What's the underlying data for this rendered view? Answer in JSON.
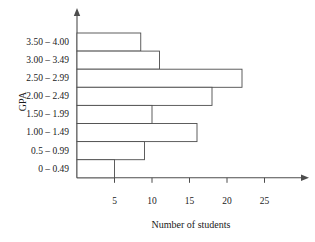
{
  "chart_data": {
    "type": "bar",
    "orientation": "horizontal",
    "title": "",
    "xlabel": "Number of students",
    "ylabel": "GPA",
    "categories": [
      "3.50 – 4.00",
      "3.00 – 3.49",
      "2.50 – 2.99",
      "2.00 – 2.49",
      "1.50 – 1.99",
      "1.00 – 1.49",
      "0.5 – 0.99",
      "0 – 0.49"
    ],
    "values": [
      8.5,
      11,
      22,
      18,
      10,
      16,
      9,
      5
    ],
    "xlim": [
      0,
      30
    ],
    "xticks": [
      5,
      10,
      15,
      20,
      25
    ],
    "xtick_labels": [
      "5",
      "10",
      "15",
      "20",
      "25"
    ],
    "grid": false,
    "legend": null,
    "bar_fill": "#ffffff",
    "bar_stroke": "#4d4d4d",
    "axis_color": "#4d4d4d"
  }
}
